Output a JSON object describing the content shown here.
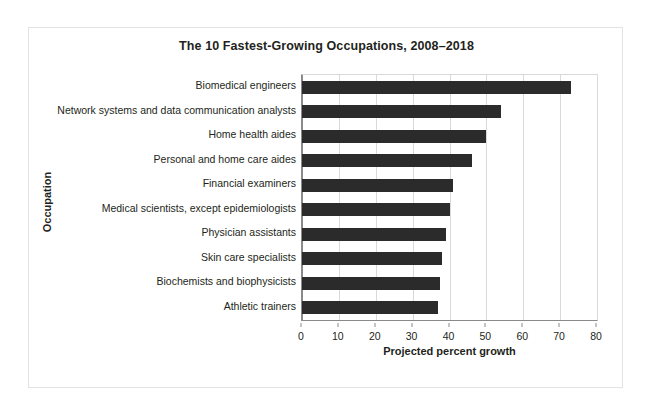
{
  "figure": {
    "title": "The 10 Fastest-Growing Occupations, 2008–2018",
    "bar_color": "#2b2b2b",
    "axis_color": "#8a8a8a",
    "grid_color": "#d9d9d9",
    "border_color": "#e3e3e3"
  },
  "chart_data": {
    "type": "bar",
    "orientation": "horizontal",
    "title": "The 10 Fastest-Growing Occupations, 2008–2018",
    "xlabel": "Projected percent growth",
    "ylabel": "Occupation",
    "categories": [
      "Biomedical engineers",
      "Network systems and data communication analysts",
      "Home health aides",
      "Personal and home care aides",
      "Financial examiners",
      "Medical scientists, except epidemiologists",
      "Physician assistants",
      "Skin care specialists",
      "Biochemists and biophysicists",
      "Athletic trainers"
    ],
    "values": [
      73,
      54,
      50,
      46,
      41,
      40,
      39,
      38,
      37.5,
      37
    ],
    "xlim": [
      0,
      80
    ],
    "xticks": [
      0,
      10,
      20,
      30,
      40,
      50,
      60,
      70,
      80
    ],
    "xtick_labels": [
      "0",
      "10",
      "20",
      "30",
      "40",
      "50",
      "60",
      "70",
      "80"
    ],
    "grid": "vertical",
    "legend": "none"
  }
}
